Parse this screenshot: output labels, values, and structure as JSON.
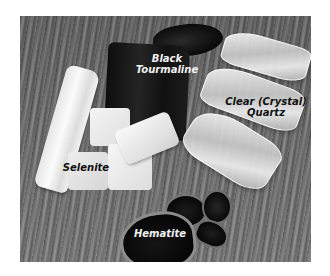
{
  "image": {
    "description": "Grayscale photo of healing crystals on a wooden surface with labels",
    "labels": {
      "black_tourmaline": {
        "line1": "Black",
        "line2": "Tourmaline"
      },
      "clear_quartz": {
        "line1": "Clear (Crystal)",
        "line2": "Quartz"
      },
      "selenite": "Selenite",
      "hematite": "Hematite"
    }
  }
}
